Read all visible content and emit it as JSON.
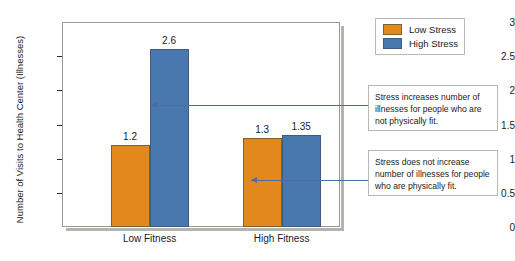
{
  "chart_data": {
    "type": "bar",
    "title": "",
    "xlabel": "",
    "ylabel": "Number of Visits to Health Center (Illnesses)",
    "categories": [
      "Low Fitness",
      "High Fitness"
    ],
    "series": [
      {
        "name": "Low Stress",
        "color": "#e2881c",
        "values": [
          1.2,
          1.3
        ],
        "value_labels": [
          "1.2",
          "1.3"
        ]
      },
      {
        "name": "High Stress",
        "color": "#4878ae",
        "values": [
          2.6,
          1.35
        ],
        "value_labels": [
          "2.6",
          "1.35"
        ]
      }
    ],
    "ylim": [
      0,
      3
    ],
    "yticks": [
      0,
      0.5,
      1,
      1.5,
      2,
      2.5,
      3
    ],
    "ytick_labels": [
      "0",
      "0.5",
      "1",
      "1.5",
      "2",
      "2.5",
      "3"
    ],
    "grid": false,
    "legend_position": "right-top",
    "annotations": [
      "Stress increases number of illnesses for people who are not physically fit.",
      "Stress does not increase number of illnesses for people who are physically fit."
    ]
  },
  "legend": {
    "items": [
      {
        "label": "Low Stress"
      },
      {
        "label": "High Stress"
      }
    ]
  },
  "callouts": [
    {
      "text": "Stress increases number of illnesses for people who are not physically fit."
    },
    {
      "text": "Stress does not increase number of illnesses for people who are physically fit."
    }
  ],
  "colors": {
    "low_stress": "#e2881c",
    "high_stress": "#4878ae",
    "arrow": "#4d6d9e",
    "frame": "#9a9a93"
  }
}
